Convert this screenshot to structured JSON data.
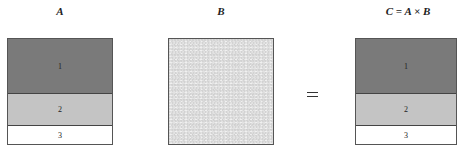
{
  "panels": {
    "a": {
      "title": "A",
      "segments": [
        "1",
        "2",
        "3"
      ]
    },
    "b": {
      "title": "B"
    },
    "c": {
      "title": "C = A × B",
      "segments": [
        "1",
        "2",
        "3"
      ]
    }
  },
  "operator": "=",
  "colors": {
    "segment1": "#7a7a7a",
    "segment2": "#c4c4c4",
    "segment3": "#ffffff",
    "matrixB": "#e2e2e2"
  }
}
